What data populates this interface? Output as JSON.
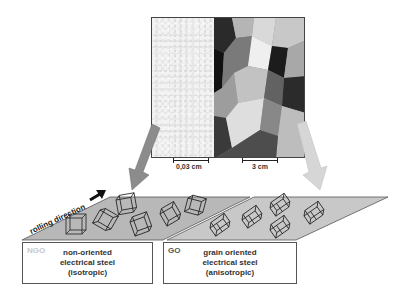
{
  "micrograph": {
    "left_region": "fine-grained microstructure",
    "right_region": "coarse-grained microstructure",
    "scale_left": "0,03 cm",
    "scale_right": "3 cm"
  },
  "arrows": {
    "left_color": "#8c8c8c",
    "right_color": "#d0d0d0"
  },
  "rolling": {
    "label": "rolling direction"
  },
  "ngo": {
    "abbr": "NGO",
    "line1": "non-oriented",
    "line2": "electrical steel",
    "line3": "(isotropic)"
  },
  "go": {
    "abbr": "GO",
    "line1": "grain oriented",
    "line2": "electrical steel",
    "line3": "(anisotropic)"
  }
}
